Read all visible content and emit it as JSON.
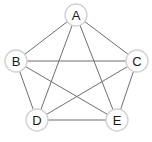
{
  "figure": {
    "name": "complete-graph-k5",
    "background_color": "#ffffff",
    "width": 152,
    "height": 142
  },
  "style": {
    "edge_color": "#6f6f6f",
    "edge_width": 1,
    "node_fill": "#ffffff",
    "node_stroke": "#d2d2d2",
    "node_stroke_width": 1.4,
    "node_radius": 11,
    "label_color": "#1a1a1a",
    "label_font_size": 13
  },
  "chart_data": {
    "type": "diagram",
    "title": "",
    "graph_kind": "undirected-complete-graph",
    "node_count": 5,
    "edge_count": 10,
    "nodes": [
      {
        "id": "A",
        "label": "A",
        "x": 76,
        "y": 15
      },
      {
        "id": "B",
        "label": "B",
        "x": 16,
        "y": 61
      },
      {
        "id": "C",
        "label": "C",
        "x": 137,
        "y": 61
      },
      {
        "id": "D",
        "label": "D",
        "x": 37,
        "y": 120
      },
      {
        "id": "E",
        "label": "E",
        "x": 117,
        "y": 120
      }
    ],
    "edges": [
      {
        "from": "A",
        "to": "B"
      },
      {
        "from": "A",
        "to": "C"
      },
      {
        "from": "A",
        "to": "D"
      },
      {
        "from": "A",
        "to": "E"
      },
      {
        "from": "B",
        "to": "C"
      },
      {
        "from": "B",
        "to": "D"
      },
      {
        "from": "B",
        "to": "E"
      },
      {
        "from": "C",
        "to": "D"
      },
      {
        "from": "C",
        "to": "E"
      },
      {
        "from": "D",
        "to": "E"
      }
    ]
  }
}
